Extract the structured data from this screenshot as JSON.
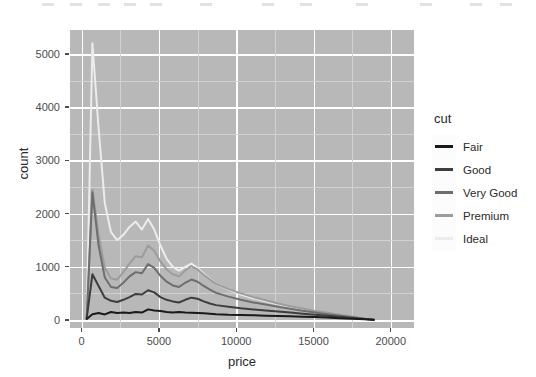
{
  "chart_data": {
    "type": "line",
    "title": "",
    "xlabel": "price",
    "ylabel": "count",
    "xlim": [
      -750,
      21500
    ],
    "ylim": [
      -150,
      5450
    ],
    "xticks": [
      0,
      5000,
      10000,
      15000,
      20000
    ],
    "xtick_labels": [
      "0",
      "5000",
      "10000",
      "15000",
      "20000"
    ],
    "yticks": [
      0,
      1000,
      2000,
      3000,
      4000,
      5000
    ],
    "ytick_labels": [
      "0",
      "1000",
      "2000",
      "3000",
      "4000",
      "5000"
    ],
    "grid": true,
    "grid_major_color": "#ffffff",
    "grid_minor_color": "#d2d2d2",
    "panel_background": "#b8b8b8",
    "legend_position": "right",
    "legend_title": "cut",
    "x": [
      330,
      700,
      1100,
      1500,
      1900,
      2300,
      2700,
      3100,
      3500,
      3900,
      4300,
      4700,
      5100,
      5500,
      5900,
      6300,
      6700,
      7100,
      7500,
      7900,
      8300,
      8700,
      9500,
      10300,
      11100,
      11900,
      12700,
      13500,
      14300,
      15100,
      15900,
      16700,
      17500,
      18300,
      18900
    ],
    "series": [
      {
        "name": "Fair",
        "color": "#1a1a1a",
        "values": [
          20,
          110,
          130,
          105,
          150,
          130,
          140,
          130,
          150,
          140,
          200,
          180,
          170,
          150,
          140,
          150,
          140,
          135,
          130,
          125,
          120,
          110,
          100,
          95,
          90,
          80,
          75,
          70,
          60,
          55,
          45,
          35,
          25,
          15,
          5
        ]
      },
      {
        "name": "Good",
        "color": "#3d3d3d",
        "values": [
          30,
          860,
          640,
          420,
          360,
          340,
          380,
          430,
          490,
          480,
          560,
          520,
          430,
          380,
          350,
          330,
          380,
          420,
          400,
          350,
          310,
          280,
          250,
          220,
          200,
          180,
          160,
          140,
          120,
          100,
          80,
          60,
          40,
          20,
          5
        ]
      },
      {
        "name": "Very Good",
        "color": "#6e6e6e",
        "values": [
          40,
          2400,
          1400,
          800,
          620,
          600,
          700,
          820,
          900,
          880,
          1050,
          980,
          830,
          720,
          650,
          620,
          700,
          760,
          720,
          640,
          570,
          510,
          440,
          380,
          330,
          290,
          250,
          210,
          175,
          140,
          110,
          80,
          50,
          25,
          5
        ]
      },
      {
        "name": "Premium",
        "color": "#9c9c9c",
        "values": [
          50,
          2450,
          1600,
          980,
          780,
          760,
          900,
          1060,
          1200,
          1180,
          1400,
          1300,
          1100,
          950,
          860,
          820,
          930,
          1010,
          950,
          850,
          760,
          680,
          580,
          500,
          430,
          370,
          310,
          260,
          215,
          170,
          135,
          100,
          65,
          30,
          5
        ]
      },
      {
        "name": "Ideal",
        "color": "#ececec",
        "values": [
          60,
          5200,
          3600,
          2200,
          1650,
          1500,
          1600,
          1750,
          1850,
          1700,
          1900,
          1700,
          1400,
          1150,
          1000,
          930,
          1000,
          1060,
          980,
          870,
          770,
          680,
          570,
          480,
          410,
          350,
          295,
          245,
          200,
          160,
          125,
          92,
          60,
          28,
          5
        ]
      }
    ]
  },
  "legend": {
    "title": "cut",
    "items": [
      {
        "label": "Fair",
        "color": "#1a1a1a"
      },
      {
        "label": "Good",
        "color": "#3d3d3d"
      },
      {
        "label": "Very Good",
        "color": "#6e6e6e"
      },
      {
        "label": "Premium",
        "color": "#9c9c9c"
      },
      {
        "label": "Ideal",
        "color": "#ececec"
      }
    ]
  }
}
